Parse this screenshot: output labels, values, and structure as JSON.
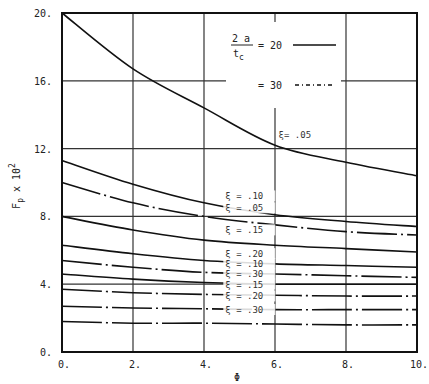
{
  "chart_data": {
    "type": "line",
    "title": "",
    "xlabel": "Φ",
    "ylabel": "F_p x 10^2",
    "ylabel_parts": {
      "main": "F",
      "sub": "p",
      "mid": " x 10",
      "sup": "2"
    },
    "xlim": [
      0,
      10
    ],
    "ylim": [
      0,
      20
    ],
    "x_ticks": [
      "0.",
      "2.",
      "4.",
      "6.",
      "8.",
      "10."
    ],
    "y_ticks": [
      "0.",
      "4.",
      "8.",
      "12.",
      "16.",
      "20."
    ],
    "grid": true,
    "x": [
      0,
      2,
      4,
      6,
      8,
      10
    ],
    "legend": {
      "ratio_label_num": "2 a",
      "ratio_label_den": "t",
      "ratio_label_den_sub": "c",
      "entries": [
        {
          "label": "= 20",
          "style": "solid"
        },
        {
          "label": "= 30",
          "style": "dash-dot"
        }
      ]
    },
    "series": [
      {
        "name": "ξ = .05 (2a/tc = 20)",
        "style": "solid",
        "xi": ".05",
        "values": [
          20.0,
          16.7,
          14.4,
          12.2,
          11.2,
          10.4
        ]
      },
      {
        "name": "ξ = .10 (2a/tc = 20)",
        "style": "solid",
        "xi": ".10",
        "values": [
          11.3,
          9.9,
          8.8,
          8.1,
          7.7,
          7.4
        ]
      },
      {
        "name": "ξ = .15 (2a/tc = 20)",
        "style": "solid",
        "xi": ".15",
        "values": [
          8.0,
          7.2,
          6.6,
          6.3,
          6.1,
          5.9
        ]
      },
      {
        "name": "ξ = .20 (2a/tc = 20)",
        "style": "solid",
        "xi": ".20",
        "values": [
          6.3,
          5.8,
          5.4,
          5.2,
          5.1,
          5.0
        ]
      },
      {
        "name": "ξ = .30 (2a/tc = 20)",
        "style": "solid",
        "xi": ".30",
        "values": [
          4.6,
          4.3,
          4.1,
          4.0,
          4.0,
          4.0
        ]
      },
      {
        "name": "ξ = .05 (2a/tc = 30)",
        "style": "dash-dot",
        "xi": ".05",
        "values": [
          10.0,
          8.8,
          8.0,
          7.5,
          7.1,
          6.9
        ]
      },
      {
        "name": "ξ = .10 (2a/tc = 30)",
        "style": "dash-dot",
        "xi": ".10",
        "values": [
          5.4,
          5.0,
          4.7,
          4.6,
          4.5,
          4.4
        ]
      },
      {
        "name": "ξ = .15 (2a/tc = 30)",
        "style": "dash-dot",
        "xi": ".15",
        "values": [
          3.7,
          3.5,
          3.4,
          3.35,
          3.3,
          3.3
        ]
      },
      {
        "name": "ξ = .20 (2a/tc = 30)",
        "style": "dash-dot",
        "xi": ".20",
        "values": [
          2.7,
          2.6,
          2.55,
          2.5,
          2.5,
          2.5
        ]
      },
      {
        "name": "ξ = .30 (2a/tc = 30)",
        "style": "dash-dot",
        "xi": ".30",
        "values": [
          1.8,
          1.7,
          1.7,
          1.65,
          1.6,
          1.6
        ]
      }
    ],
    "annotations": [
      {
        "text": "ξ= .05",
        "x": 6.1,
        "y": 12.6
      },
      {
        "text": "ξ = .10",
        "x": 4.6,
        "y": 9.0
      },
      {
        "text": "ξ = .05",
        "x": 4.6,
        "y": 8.3
      },
      {
        "text": "ξ = .15",
        "x": 4.6,
        "y": 7.0
      },
      {
        "text": "ξ = .20",
        "x": 4.6,
        "y": 5.6
      },
      {
        "text": "ξ = .10",
        "x": 4.6,
        "y": 5.0
      },
      {
        "text": "ξ = .30",
        "x": 4.6,
        "y": 4.4
      },
      {
        "text": "ξ = .15",
        "x": 4.6,
        "y": 3.8
      },
      {
        "text": "ξ = .20",
        "x": 4.6,
        "y": 3.1
      },
      {
        "text": "ξ = .30",
        "x": 4.6,
        "y": 2.3
      }
    ]
  }
}
